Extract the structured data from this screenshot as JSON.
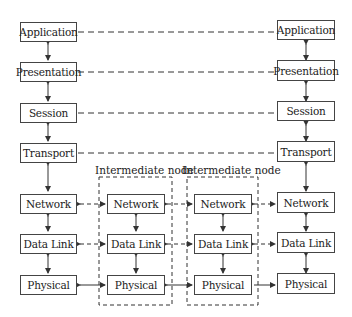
{
  "diagram": {
    "end_host_left": {
      "layers": [
        "Application",
        "Presentation",
        "Session",
        "Transport",
        "Network",
        "Data Link",
        "Physical"
      ]
    },
    "end_host_right": {
      "layers": [
        "Application",
        "Presentation",
        "Session",
        "Transport",
        "Network",
        "Data Link",
        "Physical"
      ]
    },
    "intermediate_nodes": [
      {
        "label": "Intermediate node",
        "layers": [
          "Network",
          "Data Link",
          "Physical"
        ]
      },
      {
        "label": "Intermediate node",
        "layers": [
          "Network",
          "Data Link",
          "Physical"
        ]
      }
    ],
    "connections": {
      "peer_dashed": [
        "Application",
        "Presentation",
        "Session",
        "Transport",
        "Network",
        "Data Link"
      ],
      "physical_solid": [
        "Physical"
      ]
    },
    "colors": {
      "line": "#333333",
      "box_border": "#444444",
      "background": "#ffffff"
    }
  }
}
